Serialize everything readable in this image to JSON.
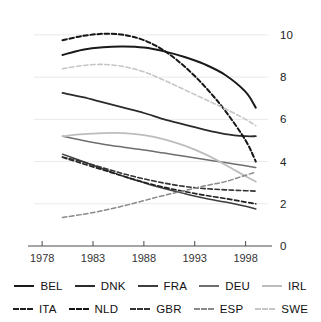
{
  "chart_data": {
    "type": "line",
    "title": "",
    "subtitle": "",
    "xlabel": "",
    "ylabel": "",
    "xlim": [
      1977.2,
      2000.2
    ],
    "ylim": [
      0,
      10.8
    ],
    "xticks": [
      1978,
      1983,
      1988,
      1993,
      1998
    ],
    "xtick_labels": [
      "1978",
      "1983",
      "1988",
      "1993",
      "1998"
    ],
    "yticks": [
      0,
      2,
      4,
      6,
      8,
      10
    ],
    "ytick_labels": [
      "0",
      "2",
      "4",
      "6",
      "8",
      "10"
    ],
    "grid": "horizontal",
    "legend_position": "bottom",
    "x": [
      1980,
      1982,
      1984,
      1986,
      1988,
      1990,
      1992,
      1994,
      1996,
      1998,
      1999
    ],
    "series": [
      {
        "name": "BEL",
        "style": "solid",
        "color": "#1a1a1a",
        "width": 2.0,
        "values": [
          9.05,
          9.3,
          9.42,
          9.45,
          9.4,
          9.22,
          8.95,
          8.6,
          8.1,
          7.3,
          6.55
        ]
      },
      {
        "name": "DNK",
        "style": "solid",
        "color": "#2b2b2b",
        "width": 1.8,
        "values": [
          7.25,
          7.05,
          6.8,
          6.55,
          6.3,
          6.0,
          5.75,
          5.5,
          5.3,
          5.2,
          5.2
        ]
      },
      {
        "name": "FRA",
        "style": "solid",
        "color": "#3d3d3d",
        "width": 1.5,
        "values": [
          4.35,
          4.0,
          3.65,
          3.3,
          3.0,
          2.72,
          2.48,
          2.26,
          2.08,
          1.88,
          1.75
        ]
      },
      {
        "name": "DEU",
        "style": "solid",
        "color": "#6e6e6e",
        "width": 1.5,
        "values": [
          5.2,
          5.0,
          4.82,
          4.68,
          4.55,
          4.4,
          4.25,
          4.1,
          3.95,
          3.8,
          3.72
        ]
      },
      {
        "name": "IRL",
        "style": "solid",
        "color": "#bdbdbd",
        "width": 1.8,
        "values": [
          5.2,
          5.3,
          5.35,
          5.35,
          5.25,
          5.05,
          4.75,
          4.35,
          3.85,
          3.3,
          3.05
        ]
      },
      {
        "name": "ITA",
        "style": "dashed",
        "color": "#1f1f1f",
        "width": 1.6,
        "values": [
          4.2,
          3.9,
          3.6,
          3.3,
          3.02,
          2.78,
          2.58,
          2.4,
          2.25,
          2.08,
          2.0
        ]
      },
      {
        "name": "NLD",
        "style": "dashed",
        "color": "#151515",
        "width": 2.0,
        "values": [
          9.75,
          9.95,
          10.05,
          10.0,
          9.75,
          9.25,
          8.5,
          7.55,
          6.4,
          5.0,
          4.0
        ]
      },
      {
        "name": "GBR",
        "style": "dashed",
        "color": "#333333",
        "width": 1.6,
        "values": [
          4.22,
          3.98,
          3.7,
          3.42,
          3.18,
          2.98,
          2.82,
          2.72,
          2.66,
          2.62,
          2.6
        ]
      },
      {
        "name": "ESP",
        "style": "dashed",
        "color": "#8a8a8a",
        "width": 1.5,
        "values": [
          1.35,
          1.5,
          1.68,
          1.9,
          2.15,
          2.4,
          2.62,
          2.85,
          3.05,
          3.35,
          3.5
        ]
      },
      {
        "name": "SWE",
        "style": "dashed",
        "color": "#c6c6c6",
        "width": 1.6,
        "values": [
          8.4,
          8.55,
          8.6,
          8.5,
          8.25,
          7.85,
          7.4,
          6.95,
          6.5,
          6.0,
          5.7
        ]
      }
    ]
  },
  "legend": {
    "rows": [
      [
        {
          "label": "BEL",
          "style": "solid",
          "color": "#1a1a1a"
        },
        {
          "label": "DNK",
          "style": "solid",
          "color": "#2b2b2b"
        },
        {
          "label": "FRA",
          "style": "solid",
          "color": "#3d3d3d"
        },
        {
          "label": "DEU",
          "style": "solid",
          "color": "#6e6e6e"
        },
        {
          "label": "IRL",
          "style": "solid",
          "color": "#bdbdbd"
        }
      ],
      [
        {
          "label": "ITA",
          "style": "dashed",
          "color": "#1f1f1f"
        },
        {
          "label": "NLD",
          "style": "dashed",
          "color": "#151515"
        },
        {
          "label": "GBR",
          "style": "dashed",
          "color": "#333333"
        },
        {
          "label": "ESP",
          "style": "dashed",
          "color": "#8a8a8a"
        },
        {
          "label": "SWE",
          "style": "dashed",
          "color": "#c6c6c6"
        }
      ]
    ]
  },
  "axes": {
    "grid_color": "#e9e9e9",
    "axis_color": "#4a4a4a",
    "tick_text_color": "#333333"
  }
}
